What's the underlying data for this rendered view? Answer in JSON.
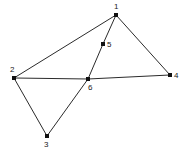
{
  "figure": {
    "kind": "node-link-graph",
    "width": 183,
    "height": 154,
    "background_color": "#ffffff",
    "edge_color": "#2b2b2b",
    "node_color": "#111111",
    "label_color": "#1a1a1a",
    "node_marker": "square",
    "node_marker_size": 4,
    "edge_width": 1
  },
  "nodes": [
    {
      "id": "1",
      "label": "1",
      "x": 116,
      "y": 15,
      "label_x": 114,
      "label_y": 3,
      "label_anchor": "above"
    },
    {
      "id": "2",
      "label": "2",
      "x": 14,
      "y": 78,
      "label_x": 10,
      "label_y": 66,
      "label_anchor": "above-left"
    },
    {
      "id": "3",
      "label": "3",
      "x": 47,
      "y": 136,
      "label_x": 44,
      "label_y": 141,
      "label_anchor": "below"
    },
    {
      "id": "4",
      "label": "4",
      "x": 170,
      "y": 75,
      "label_x": 174,
      "label_y": 72,
      "label_anchor": "right"
    },
    {
      "id": "5",
      "label": "5",
      "x": 103,
      "y": 44,
      "label_x": 107,
      "label_y": 41,
      "label_anchor": "right"
    },
    {
      "id": "6",
      "label": "6",
      "x": 88,
      "y": 79,
      "label_x": 88,
      "label_y": 84,
      "label_anchor": "below-right"
    }
  ],
  "edges": [
    {
      "id": "edge-1-2",
      "source": "1",
      "target": "2"
    },
    {
      "id": "edge-1-5",
      "source": "1",
      "target": "5"
    },
    {
      "id": "edge-5-6",
      "source": "5",
      "target": "6"
    },
    {
      "id": "edge-1-4",
      "source": "1",
      "target": "4"
    },
    {
      "id": "edge-2-6",
      "source": "2",
      "target": "6"
    },
    {
      "id": "edge-6-4",
      "source": "6",
      "target": "4"
    },
    {
      "id": "edge-2-3",
      "source": "2",
      "target": "3"
    },
    {
      "id": "edge-3-6",
      "source": "3",
      "target": "6"
    }
  ]
}
